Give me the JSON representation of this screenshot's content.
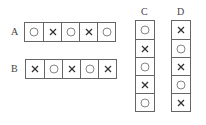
{
  "rows": [
    {
      "label": "A",
      "cells": [
        "circle",
        "cross",
        "circle",
        "cross",
        "circle"
      ]
    },
    {
      "label": "B",
      "cells": [
        "cross",
        "circle",
        "cross",
        "circle",
        "cross"
      ]
    }
  ],
  "columns": [
    {
      "label": "C",
      "cells": [
        "circle",
        "cross",
        "circle",
        "cross",
        "circle"
      ]
    },
    {
      "label": "D",
      "cells": [
        "cross",
        "circle",
        "cross",
        "circle",
        "cross"
      ]
    }
  ]
}
